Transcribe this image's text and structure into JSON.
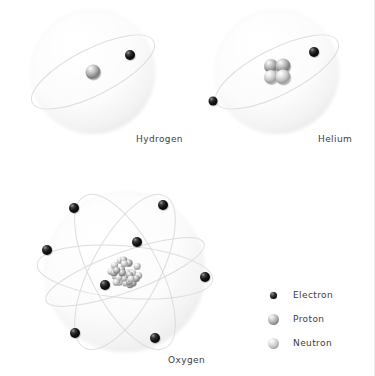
{
  "diagram": {
    "background_color": "#ffffff",
    "label_color": "#3d3d3d",
    "shell_color": "#f4f4f4",
    "orbit_color": "#d8d8d8"
  },
  "atoms": [
    {
      "name": "Hydrogen",
      "label": "Hydrogen",
      "protons": 1,
      "neutrons": 0,
      "electrons": 1,
      "center": {
        "x": 93,
        "y": 72
      },
      "shell_radius": 62,
      "label_pos": {
        "x": 136,
        "y": 134
      },
      "orbits": [
        {
          "rx": 68,
          "ry": 23,
          "rotate": -27
        }
      ],
      "electron_positions": [
        {
          "x": 130,
          "y": 55,
          "r": 5
        }
      ],
      "nucleons": [
        {
          "type": "proton",
          "x": 0,
          "y": 0,
          "r": 7.5
        }
      ]
    },
    {
      "name": "Helium",
      "label": "Helium",
      "protons": 2,
      "neutrons": 2,
      "electrons": 2,
      "center": {
        "x": 277,
        "y": 72
      },
      "shell_radius": 62,
      "label_pos": {
        "x": 318,
        "y": 134
      },
      "orbits": [
        {
          "rx": 68,
          "ry": 23,
          "rotate": -27
        }
      ],
      "electron_positions": [
        {
          "x": 314,
          "y": 52,
          "r": 5
        },
        {
          "x": 213,
          "y": 101,
          "r": 4.5
        }
      ],
      "nucleons": [
        {
          "type": "proton",
          "x": -6,
          "y": -6,
          "r": 7
        },
        {
          "type": "proton",
          "x": 6,
          "y": -6,
          "r": 7.5
        },
        {
          "type": "neutron",
          "x": -6,
          "y": 5,
          "r": 7
        },
        {
          "type": "neutron",
          "x": 6,
          "y": 5,
          "r": 7.5
        }
      ]
    },
    {
      "name": "Oxygen",
      "label": "Oxygen",
      "protons": 8,
      "neutrons": 8,
      "electrons": 8,
      "center": {
        "x": 125,
        "y": 272
      },
      "shell_radius": 80,
      "label_pos": {
        "x": 168,
        "y": 355
      },
      "orbits": [
        {
          "rx": 88,
          "ry": 26,
          "rotate": 5
        },
        {
          "rx": 86,
          "ry": 34,
          "rotate": 62
        },
        {
          "rx": 86,
          "ry": 34,
          "rotate": -62
        },
        {
          "rx": 84,
          "ry": 20,
          "rotate": -20
        }
      ],
      "electron_positions": [
        {
          "x": 74,
          "y": 208,
          "r": 5
        },
        {
          "x": 163,
          "y": 205,
          "r": 5
        },
        {
          "x": 47,
          "y": 250,
          "r": 5
        },
        {
          "x": 137,
          "y": 242,
          "r": 5
        },
        {
          "x": 105,
          "y": 285,
          "r": 5
        },
        {
          "x": 205,
          "y": 277,
          "r": 5
        },
        {
          "x": 75,
          "y": 333,
          "r": 5
        },
        {
          "x": 155,
          "y": 338,
          "r": 5
        }
      ],
      "nucleus_cluster": {
        "radius": 18,
        "nucleon_radius": 3.6,
        "count": 16
      }
    }
  ],
  "legend": {
    "position": {
      "x": 262,
      "y": 283
    },
    "items": [
      {
        "label": "Electron",
        "type": "electron",
        "size": 7
      },
      {
        "label": "Proton",
        "type": "proton",
        "size": 11
      },
      {
        "label": "Neutron",
        "type": "neutron",
        "size": 11
      }
    ]
  }
}
